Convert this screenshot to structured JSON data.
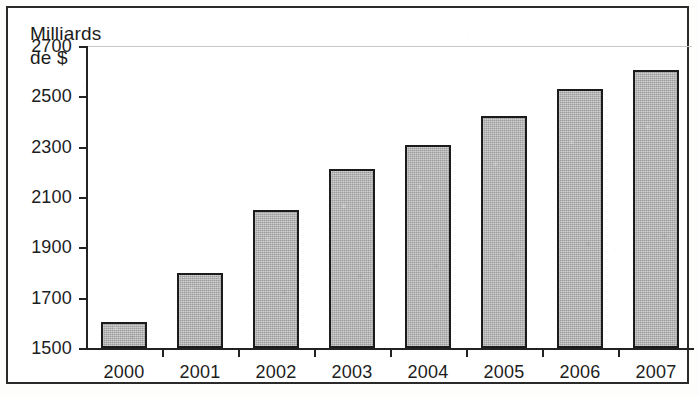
{
  "chart_data": {
    "type": "bar",
    "title": "",
    "subtitle": "",
    "annotation": "Milliards\nde $",
    "annotation_lines": [
      "Milliards",
      "de $"
    ],
    "xlabel": "",
    "ylabel": "Milliards de $",
    "categories": [
      "2000",
      "2001",
      "2002",
      "2003",
      "2004",
      "2005",
      "2006",
      "2007"
    ],
    "values": [
      1605,
      1800,
      2050,
      2210,
      2305,
      2420,
      2530,
      2605
    ],
    "ylim": [
      1500,
      2700
    ],
    "ytick_labels": [
      "2700",
      "2500",
      "2300",
      "2100",
      "1900",
      "1700",
      "1500"
    ],
    "ytick_values": [
      2700,
      2500,
      2300,
      2100,
      1900,
      1700,
      1500
    ],
    "ytick_step": 200,
    "grid": false,
    "top_gridline": true,
    "legend": null,
    "bar_fill_color": "#aeaeae",
    "bar_border_color": "#1b1b1b",
    "axis_color": "#222222",
    "background_color": "#ffffff",
    "frame_border_color": "#2a2a2a"
  }
}
